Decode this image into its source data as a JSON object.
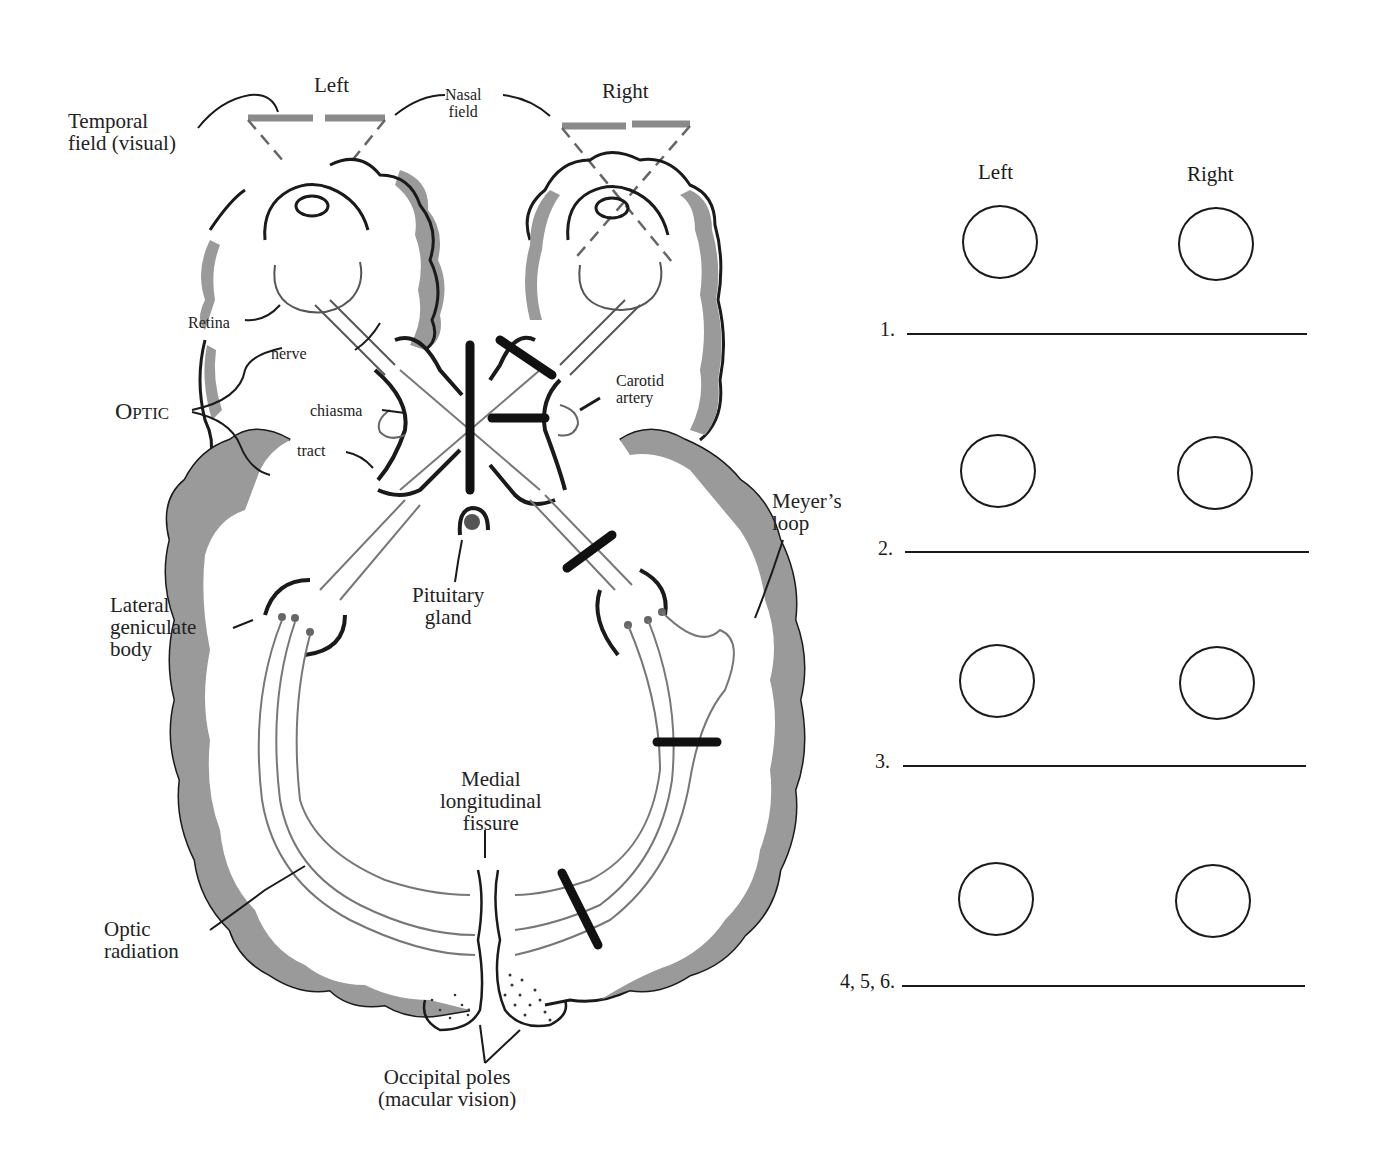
{
  "figure": {
    "colors": {
      "cortex_shade": "#9a9a9a",
      "ink": "#1a1a1a",
      "pathway": "#777777",
      "lesion": "#111111"
    },
    "eye_labels": {
      "left": "Left",
      "right": "Right"
    },
    "labels": {
      "temporal_field": [
        "Temporal",
        "field (visual)"
      ],
      "nasal_field": [
        "Nasal",
        "field"
      ],
      "retina": "Retina",
      "optic_nerve": "nerve",
      "optic": "Optic",
      "optic_chiasma": "chiasma",
      "optic_tract": "tract",
      "carotid_artery": [
        "Carotid",
        "artery"
      ],
      "meyers_loop": [
        "Meyer’s",
        "loop"
      ],
      "lateral_geniculate_body": [
        "Lateral",
        "geniculate",
        "body"
      ],
      "pituitary_gland": [
        "Pituitary",
        "gland"
      ],
      "medial_longitudinal_fissure": [
        "Medial",
        "longitudinal",
        "fissure"
      ],
      "optic_radiation": [
        "Optic",
        "radiation"
      ],
      "occipital_poles": [
        "Occipital poles",
        "(macular vision)"
      ]
    },
    "lesion_count": 6
  },
  "worksheet": {
    "columns": {
      "left": "Left",
      "right": "Right"
    },
    "rows": [
      {
        "number": "1.",
        "answer": ""
      },
      {
        "number": "2.",
        "answer": ""
      },
      {
        "number": "3.",
        "answer": ""
      },
      {
        "number": "4, 5, 6.",
        "answer": ""
      }
    ]
  }
}
